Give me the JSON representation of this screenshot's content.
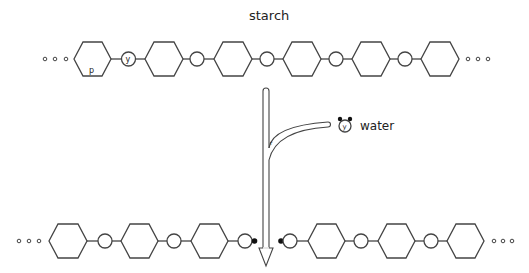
{
  "title": "starch",
  "reactant_label": "water",
  "top_chain": {
    "name": "starch",
    "hexagon_count": 6,
    "linker_count": 5,
    "first_hexagon_label": "p",
    "first_linker_label": "y",
    "ellipsis_left": true,
    "ellipsis_right": true
  },
  "water_molecule": {
    "center_label": "y",
    "attached_atoms": 2
  },
  "arrow": {
    "direction": "down",
    "merge_label": "r"
  },
  "bottom_left_fragment": {
    "hexagon_count": 3,
    "linker_count": 3,
    "end_atom": "filled",
    "ellipsis_left": true
  },
  "bottom_right_fragment": {
    "hexagon_count": 3,
    "linker_count": 3,
    "start_atom": "filled",
    "ellipsis_right": true
  },
  "colors": {
    "line": "#444444",
    "text": "#222222",
    "background": "#ffffff",
    "filled_atom": "#111111"
  }
}
